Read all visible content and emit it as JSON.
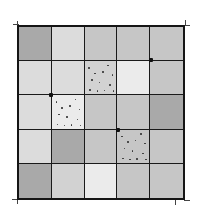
{
  "diagram": {
    "type": "grid",
    "rows": 5,
    "cols": 5,
    "line_color": "#151515",
    "shades": {
      "dark": "#a9a9a9",
      "medium": "#c6c6c6",
      "medium_light": "#d2d2d2",
      "light": "#dcdcdc",
      "very_light": "#ebebeb"
    },
    "cells": [
      [
        {
          "shade": "dark",
          "dotted": false
        },
        {
          "shade": "light",
          "dotted": false
        },
        {
          "shade": "medium",
          "dotted": false
        },
        {
          "shade": "medium",
          "dotted": false
        },
        {
          "shade": "medium",
          "dotted": false
        }
      ],
      [
        {
          "shade": "light",
          "dotted": false
        },
        {
          "shade": "light",
          "dotted": false
        },
        {
          "shade": "medium_light",
          "dotted": true
        },
        {
          "shade": "very_light",
          "dotted": false
        },
        {
          "shade": "medium",
          "dotted": false
        }
      ],
      [
        {
          "shade": "light",
          "dotted": false
        },
        {
          "shade": "very_light",
          "dotted": true
        },
        {
          "shade": "medium",
          "dotted": false
        },
        {
          "shade": "medium",
          "dotted": false
        },
        {
          "shade": "dark",
          "dotted": false
        }
      ],
      [
        {
          "shade": "light",
          "dotted": false
        },
        {
          "shade": "dark",
          "dotted": false
        },
        {
          "shade": "medium",
          "dotted": false
        },
        {
          "shade": "medium",
          "dotted": true
        },
        {
          "shade": "medium",
          "dotted": false
        }
      ],
      [
        {
          "shade": "dark",
          "dotted": false
        },
        {
          "shade": "medium_light",
          "dotted": false
        },
        {
          "shade": "very_light",
          "dotted": false
        },
        {
          "shade": "medium",
          "dotted": false
        },
        {
          "shade": "medium",
          "dotted": false
        }
      ]
    ],
    "intersection_marks": [
      {
        "row": 1,
        "col": 4
      },
      {
        "row": 2,
        "col": 1
      },
      {
        "row": 3,
        "col": 3
      }
    ]
  }
}
